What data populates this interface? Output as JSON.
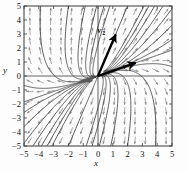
{
  "figure": {
    "title": "",
    "xlabel": "x",
    "ylabel": "y"
  },
  "labels": {
    "v1_symbol": "v",
    "v1_subscript": "1",
    "v2_symbol": "v",
    "v2_subscript": "2"
  },
  "colors": {
    "frame": "#4a4a4a",
    "axis": "#3a3a3a",
    "trajectory": "#595959",
    "field_arrow": "#8c8c8c",
    "eigenvector": "#000000",
    "background": "#fdfdfd",
    "text": "#111111"
  },
  "chart_data": {
    "type": "scatter",
    "title": "",
    "xlabel": "x",
    "ylabel": "y",
    "xlim": [
      -5,
      5
    ],
    "ylim": [
      -5,
      5
    ],
    "xticks": [
      -5,
      -4,
      -3,
      -2,
      -1,
      0,
      1,
      2,
      3,
      4,
      5
    ],
    "yticks": [
      -5,
      -4,
      -3,
      -2,
      -1,
      0,
      1,
      2,
      3,
      4,
      5
    ],
    "xtick_labels": [
      "-5",
      "-4",
      "-3",
      "-2",
      "-1",
      "0",
      "1",
      "2",
      "3",
      "4",
      "5"
    ],
    "ytick_labels": [
      "5",
      "4",
      "3",
      "2",
      "1",
      "0",
      "-1",
      "-2",
      "-3",
      "-4",
      "-5"
    ],
    "grid": false,
    "legend": "none",
    "plot_kind": "phase-portrait-direction-field",
    "equilibrium": {
      "x": 0,
      "y": 0,
      "classification": "unstable node (source)"
    },
    "eigenvectors": [
      {
        "name": "v1",
        "label": "v₁",
        "direction": [
          1.0,
          0.37
        ],
        "angle_deg": 20,
        "drawn_length": 2.7,
        "tip": [
          2.55,
          0.94
        ],
        "style": "thick black arrow"
      },
      {
        "name": "v2",
        "label": "v₂",
        "direction": [
          0.4,
          1.0
        ],
        "angle_deg": 68,
        "drawn_length": 3.2,
        "tip": [
          1.2,
          2.98
        ],
        "style": "thick black arrow"
      }
    ],
    "field_arrow_grid": {
      "x": [
        -4.6,
        -3.9,
        -3.2,
        -2.5,
        -1.8,
        -1.1,
        -0.4,
        0.4,
        1.1,
        1.8,
        2.5,
        3.2,
        3.9,
        4.6
      ],
      "y": [
        -4.6,
        -3.9,
        -3.2,
        -2.5,
        -1.8,
        -1.1,
        -0.4,
        0.4,
        1.1,
        1.8,
        2.5,
        3.2,
        3.9,
        4.6
      ],
      "description": "normalized direction arrows of the linear system, radiating away from origin"
    },
    "trajectories": {
      "count": 26,
      "description": "solution curves leaving the origin tangent to v1 then bending toward the v2 direction; upper-right and lower-left quadrants show near-straight rays, upper-left and lower-right show strongly curved branches"
    }
  }
}
